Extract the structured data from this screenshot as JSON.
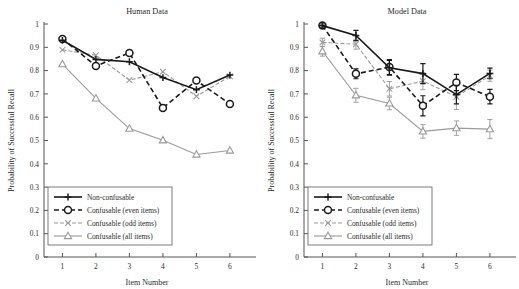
{
  "figure": {
    "name": "two-panel-line-plot",
    "panels": [
      "human",
      "model"
    ]
  },
  "colors": {
    "dark": "#1a1a1a",
    "gray": "#9a9a9a",
    "axis": "#555555",
    "background": "#ffffff",
    "legend_border": "#6e6e6e"
  },
  "axes": {
    "xlabel": "Item Number",
    "ylabel": "Probability of Successful Recall",
    "xticks": [
      "1",
      "2",
      "3",
      "4",
      "5",
      "6"
    ],
    "yticks": [
      "0",
      "0.1",
      "0.2",
      "0.3",
      "0.4",
      "0.5",
      "0.6",
      "0.7",
      "0.8",
      "0.9",
      "1"
    ],
    "xlim": [
      0.45,
      6.6
    ],
    "ylim": [
      0,
      1
    ]
  },
  "legend": {
    "items": [
      {
        "label": "Non-confusable",
        "marker": "plus",
        "color": "#1a1a1a",
        "dash": "solid"
      },
      {
        "label": "Confusable (even items)",
        "marker": "circle",
        "color": "#1a1a1a",
        "dash": "dashed"
      },
      {
        "label": "Confusable (odd items)",
        "marker": "cross",
        "color": "#9a9a9a",
        "dash": "dashdot"
      },
      {
        "label": "Confusable (all items)",
        "marker": "triangle",
        "color": "#9a9a9a",
        "dash": "solid"
      }
    ]
  },
  "chart_data": [
    {
      "type": "line",
      "title": "Human Data",
      "xlabel": "Item Number",
      "ylabel": "Probability of Successful Recall",
      "x": [
        1,
        2,
        3,
        4,
        5,
        6
      ],
      "xlim": [
        0.45,
        6.6
      ],
      "ylim": [
        0,
        1
      ],
      "grid": false,
      "legend_position": "lower-left",
      "errorbars": false,
      "series": [
        {
          "name": "Non-confusable",
          "marker": "plus",
          "color": "#1a1a1a",
          "dash": "solid",
          "values": [
            0.93,
            0.848,
            0.838,
            0.77,
            0.718,
            0.781
          ]
        },
        {
          "name": "Confusable (even items)",
          "marker": "circle",
          "color": "#1a1a1a",
          "dash": "dashed",
          "values": [
            0.936,
            0.82,
            0.876,
            0.64,
            0.757,
            0.657
          ]
        },
        {
          "name": "Confusable (odd items)",
          "marker": "cross",
          "color": "#9a9a9a",
          "dash": "dashdot",
          "values": [
            0.889,
            0.866,
            0.759,
            0.795,
            0.69,
            0.775
          ]
        },
        {
          "name": "Confusable (all items)",
          "marker": "triangle",
          "color": "#9a9a9a",
          "dash": "solid",
          "values": [
            0.828,
            0.681,
            0.551,
            0.501,
            0.44,
            0.457
          ]
        }
      ]
    },
    {
      "type": "line",
      "title": "Model Data",
      "xlabel": "Item Number",
      "ylabel": "Probability of Successful Recall",
      "x": [
        1,
        2,
        3,
        4,
        5,
        6
      ],
      "xlim": [
        0.45,
        6.6
      ],
      "ylim": [
        0,
        1
      ],
      "grid": false,
      "legend_position": "lower-left",
      "errorbars": true,
      "series": [
        {
          "name": "Non-confusable",
          "marker": "plus",
          "color": "#1a1a1a",
          "dash": "solid",
          "values": [
            0.993,
            0.951,
            0.812,
            0.787,
            0.697,
            0.788
          ],
          "errors": [
            0.009,
            0.022,
            0.032,
            0.043,
            0.04,
            0.023
          ]
        },
        {
          "name": "Confusable (even items)",
          "marker": "circle",
          "color": "#1a1a1a",
          "dash": "dashed",
          "values": [
            0.994,
            0.786,
            0.815,
            0.649,
            0.749,
            0.688
          ],
          "errors": [
            0.009,
            0.021,
            0.032,
            0.043,
            0.035,
            0.031
          ]
        },
        {
          "name": "Confusable (odd items)",
          "marker": "cross",
          "color": "#9a9a9a",
          "dash": "dashdot",
          "values": [
            0.921,
            0.913,
            0.722,
            0.755,
            0.688,
            0.778
          ],
          "errors": [
            0.018,
            0.021,
            0.031,
            0.037,
            0.055,
            0.024
          ]
        },
        {
          "name": "Confusable (all items)",
          "marker": "triangle",
          "color": "#9a9a9a",
          "dash": "solid",
          "values": [
            0.883,
            0.694,
            0.659,
            0.539,
            0.553,
            0.549
          ],
          "errors": [
            0.021,
            0.03,
            0.027,
            0.029,
            0.031,
            0.041
          ]
        }
      ]
    }
  ]
}
